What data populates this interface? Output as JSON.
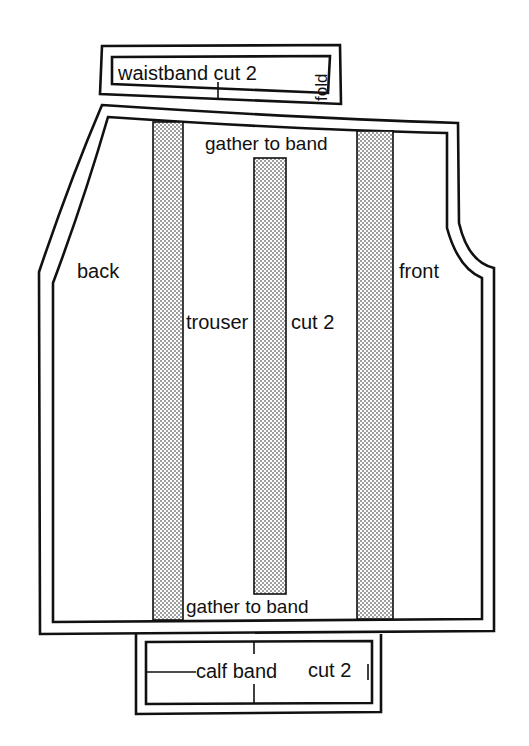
{
  "diagram": {
    "type": "sewing-pattern",
    "colors": {
      "ink": "#111111",
      "paper": "#ffffff"
    },
    "pieces": {
      "waistband": {
        "label": "waistband cut 2",
        "fold_label": "fold"
      },
      "trouser": {
        "label_main": "trouser",
        "label_cut": "cut 2",
        "back_label": "back",
        "front_label": "front",
        "top_note": "gather to band",
        "bottom_note": "gather to band"
      },
      "calf_band": {
        "label": "calf band",
        "cut_label": "cut 2"
      }
    }
  }
}
